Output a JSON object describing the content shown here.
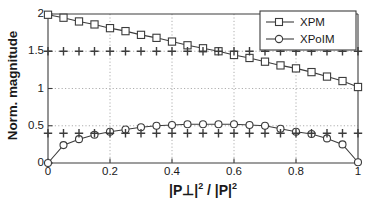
{
  "chart_data": {
    "type": "line",
    "title": "",
    "xlabel": "|P⊥|² / |P|²",
    "ylabel": "Norm. magnitude",
    "xlim": [
      0,
      1
    ],
    "ylim": [
      0,
      2
    ],
    "grid": true,
    "grid_style": "dotted",
    "legend_position": "top-right",
    "xticks": [
      0,
      0.2,
      0.4,
      0.6,
      0.8,
      1
    ],
    "xtick_labels": [
      "0",
      "0.2",
      "0.4",
      "0.6",
      "0.8",
      "1"
    ],
    "yticks": [
      0,
      0.5,
      1,
      1.5,
      2
    ],
    "ytick_labels": [
      "0",
      "0.5",
      "1",
      "1.5",
      "2"
    ],
    "x": [
      0,
      0.05,
      0.1,
      0.15,
      0.2,
      0.25,
      0.3,
      0.35,
      0.4,
      0.45,
      0.5,
      0.55,
      0.6,
      0.65,
      0.7,
      0.75,
      0.8,
      0.85,
      0.9,
      0.95,
      1
    ],
    "series": [
      {
        "name": "XPM",
        "marker": "square",
        "color": "#3c3c3c",
        "values": [
          1.99,
          1.95,
          1.9,
          1.86,
          1.81,
          1.77,
          1.72,
          1.68,
          1.63,
          1.58,
          1.54,
          1.5,
          1.45,
          1.41,
          1.36,
          1.31,
          1.27,
          1.22,
          1.16,
          1.1,
          1.02
        ]
      },
      {
        "name": "XPoIM",
        "marker": "circle",
        "color": "#3c3c3c",
        "values": [
          0.0,
          0.24,
          0.32,
          0.38,
          0.42,
          0.45,
          0.48,
          0.5,
          0.51,
          0.52,
          0.52,
          0.52,
          0.52,
          0.51,
          0.5,
          0.46,
          0.42,
          0.39,
          0.33,
          0.25,
          0.01
        ]
      },
      {
        "name": "reference-upper",
        "marker": "plus",
        "color": "#3c3c3c",
        "values": [
          1.5,
          1.5,
          1.5,
          1.5,
          1.5,
          1.5,
          1.5,
          1.5,
          1.5,
          1.5,
          1.5,
          1.5,
          1.5,
          1.5,
          1.5,
          1.5,
          1.5,
          1.5,
          1.5,
          1.5,
          1.5
        ]
      },
      {
        "name": "reference-lower",
        "marker": "plus",
        "color": "#3c3c3c",
        "values": [
          0.4,
          0.4,
          0.4,
          0.4,
          0.4,
          0.4,
          0.4,
          0.4,
          0.4,
          0.4,
          0.4,
          0.4,
          0.4,
          0.4,
          0.4,
          0.4,
          0.4,
          0.4,
          0.4,
          0.4,
          0.4
        ]
      }
    ],
    "legend_entries": [
      {
        "label": "XPM",
        "marker": "square"
      },
      {
        "label": "XPoIM",
        "marker": "circle"
      }
    ]
  },
  "axes": {
    "ylabel": "Norm. magnitude",
    "xlabel_base": "|P⊥|",
    "xlabel_exp1": "2",
    "xlabel_mid": " / |P|",
    "xlabel_exp2": "2",
    "xtick_labels": [
      "0",
      "0.2",
      "0.4",
      "0.6",
      "0.8",
      "1"
    ],
    "ytick_labels": [
      "0",
      "0.5",
      "1",
      "1.5",
      "2"
    ]
  },
  "legend": {
    "items": [
      {
        "label": "XPM"
      },
      {
        "label": "XPoIM"
      }
    ]
  },
  "colors": {
    "line": "#3c3c3c",
    "axis": "#3c3c3c",
    "grid": "#9a9a9a",
    "text": "#1a1a1a",
    "background": "#ffffff"
  }
}
